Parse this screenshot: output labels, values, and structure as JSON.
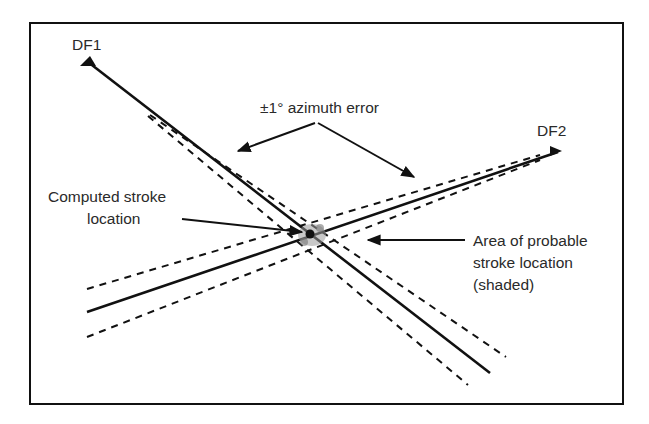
{
  "diagram": {
    "labels": {
      "df1": "DF1",
      "df2": "DF2",
      "azimuth_error": "±1° azimuth error",
      "computed_line1": "Computed stroke",
      "computed_line2": "location",
      "area_line1": "Area of probable",
      "area_line2": "stroke location",
      "area_line3": "(shaded)"
    },
    "colors": {
      "ink": "#111111",
      "text": "#2a2a2a",
      "background": "#ffffff",
      "shade": "#9a9a9a"
    }
  }
}
